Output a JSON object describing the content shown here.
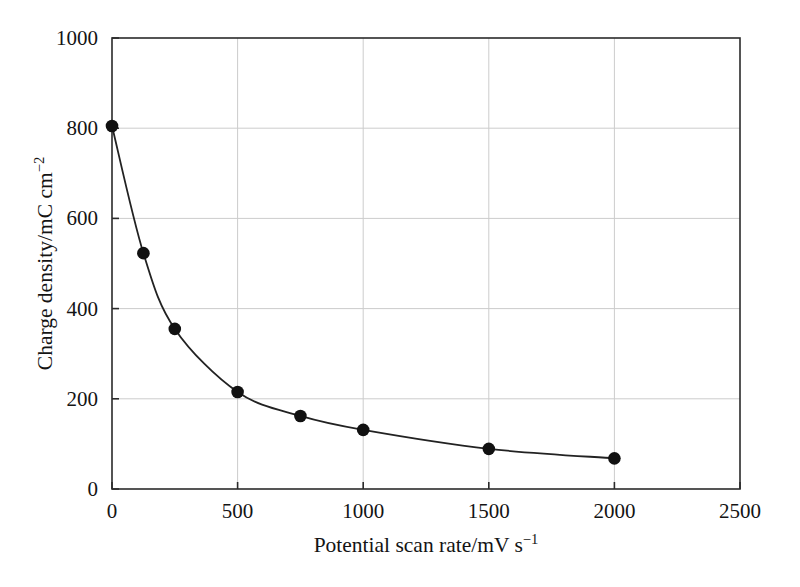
{
  "chart_data": {
    "type": "line",
    "title": "",
    "subtitle": "",
    "xlabel": "Potential scan rate/mV s⁻¹",
    "ylabel": "Charge density/mC cm⁻²",
    "xlabel_parts": {
      "base": "Potential scan rate/mV s",
      "exponent": "−1"
    },
    "ylabel_parts": {
      "base": "Charge density/mC cm",
      "exponent": "−2"
    },
    "xlim": [
      0,
      2500
    ],
    "ylim": [
      0,
      1000
    ],
    "xticks": [
      0,
      500,
      1000,
      1500,
      2000,
      2500
    ],
    "yticks": [
      0,
      200,
      400,
      600,
      800,
      1000
    ],
    "xtick_labels": [
      "0",
      "500",
      "1000",
      "1500",
      "2000",
      "2500"
    ],
    "ytick_labels": [
      "0",
      "200",
      "400",
      "600",
      "800",
      "1000"
    ],
    "grid": true,
    "grid_color": "#cccccc",
    "legend": null,
    "legend_position": "none",
    "series": [
      {
        "name": "charge density vs scan rate",
        "marker": "filled-circle",
        "marker_color": "#111111",
        "line_color": "#222222",
        "x": [
          0,
          125,
          250,
          500,
          750,
          1000,
          1500,
          2000
        ],
        "y": [
          805,
          523,
          355,
          215,
          162,
          131,
          89,
          68
        ]
      }
    ]
  },
  "figure": {
    "background_color": "#ffffff",
    "axis_color": "#2b2b2b",
    "text_color": "#141414"
  }
}
